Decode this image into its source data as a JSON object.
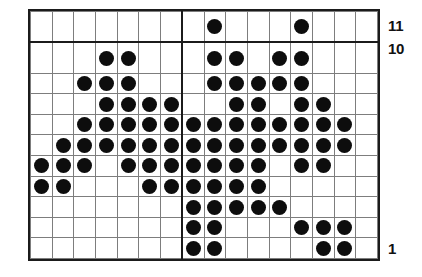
{
  "chart_data": {
    "type": "heatmap",
    "title": "",
    "subtitle": "",
    "xlabel": "",
    "ylabel": "",
    "columns": 16,
    "rows": 11,
    "grid": true,
    "legend": "none",
    "cell_on_symbol": "filled-dot",
    "cell_off_symbol": "empty",
    "dot_color": "#0d0d0d",
    "grid_line_color": "#7d7d7d",
    "border_color": "#1b1b1b",
    "background_color": "#ffffff",
    "heavy_divider_after_column": 7,
    "heavy_divider_after_top_row": 1,
    "column_labels": [
      "1",
      "2",
      "3",
      "4",
      "5",
      "6",
      "7",
      "8",
      "9",
      "10",
      "11",
      "12",
      "13",
      "14",
      "15",
      "16"
    ],
    "row_labels_top_to_bottom": [
      "11",
      "10",
      "9",
      "8",
      "7",
      "6",
      "5",
      "4",
      "3",
      "2",
      "1"
    ],
    "visible_row_labels": [
      {
        "row": "11",
        "text": "11"
      },
      {
        "row": "10",
        "text": "10"
      },
      {
        "row": "1",
        "text": "1"
      }
    ],
    "rows_top_to_bottom": [
      {
        "row": "11",
        "filled_columns": [
          9,
          13
        ]
      },
      {
        "row": "10",
        "filled_columns": [
          4,
          5,
          9,
          10,
          12,
          13
        ]
      },
      {
        "row": "9",
        "filled_columns": [
          3,
          4,
          5,
          9,
          10,
          11,
          12,
          13
        ]
      },
      {
        "row": "8",
        "filled_columns": [
          4,
          5,
          6,
          7,
          10,
          11,
          13,
          14
        ]
      },
      {
        "row": "7",
        "filled_columns": [
          3,
          4,
          5,
          6,
          7,
          8,
          9,
          10,
          11,
          12,
          13,
          14,
          15
        ]
      },
      {
        "row": "6",
        "filled_columns": [
          2,
          3,
          4,
          5,
          6,
          7,
          8,
          9,
          10,
          11,
          12,
          13,
          14,
          15
        ]
      },
      {
        "row": "5",
        "filled_columns": [
          1,
          2,
          3,
          5,
          6,
          7,
          8,
          9,
          10,
          11,
          13,
          14
        ]
      },
      {
        "row": "4",
        "filled_columns": [
          1,
          2,
          6,
          7,
          8,
          9,
          10,
          11
        ]
      },
      {
        "row": "3",
        "filled_columns": [
          8,
          9,
          10,
          11,
          12
        ]
      },
      {
        "row": "2",
        "filled_columns": [
          8,
          9,
          12,
          13,
          14
        ]
      },
      {
        "row": "1",
        "filled_columns": [
          8,
          9,
          13,
          14
        ]
      }
    ],
    "matrix_top_to_bottom": [
      [
        0,
        0,
        0,
        0,
        0,
        0,
        0,
        0,
        1,
        0,
        0,
        0,
        1,
        0,
        0,
        0
      ],
      [
        0,
        0,
        0,
        1,
        1,
        0,
        0,
        0,
        1,
        1,
        0,
        1,
        1,
        0,
        0,
        0
      ],
      [
        0,
        0,
        1,
        1,
        1,
        0,
        0,
        0,
        1,
        1,
        1,
        1,
        1,
        0,
        0,
        0
      ],
      [
        0,
        0,
        0,
        1,
        1,
        1,
        1,
        0,
        0,
        1,
        1,
        0,
        1,
        1,
        0,
        0
      ],
      [
        0,
        0,
        1,
        1,
        1,
        1,
        1,
        1,
        1,
        1,
        1,
        1,
        1,
        1,
        1,
        0
      ],
      [
        0,
        1,
        1,
        1,
        1,
        1,
        1,
        1,
        1,
        1,
        1,
        1,
        1,
        1,
        1,
        0
      ],
      [
        1,
        1,
        1,
        0,
        1,
        1,
        1,
        1,
        1,
        1,
        1,
        0,
        1,
        1,
        0,
        0
      ],
      [
        1,
        1,
        0,
        0,
        0,
        1,
        1,
        1,
        1,
        1,
        1,
        0,
        0,
        0,
        0,
        0
      ],
      [
        0,
        0,
        0,
        0,
        0,
        0,
        0,
        1,
        1,
        1,
        1,
        1,
        0,
        0,
        0,
        0
      ],
      [
        0,
        0,
        0,
        0,
        0,
        0,
        0,
        1,
        1,
        0,
        0,
        0,
        1,
        1,
        1,
        0
      ],
      [
        0,
        0,
        0,
        0,
        0,
        0,
        0,
        1,
        1,
        0,
        0,
        0,
        0,
        1,
        1,
        0
      ]
    ],
    "total_filled_cells": 96
  },
  "labels": {
    "top": "11",
    "second": "10",
    "bottom": "1"
  }
}
